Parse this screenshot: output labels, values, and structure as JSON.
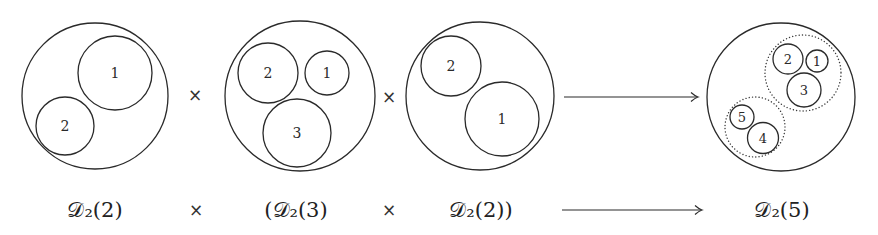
{
  "diagram": {
    "stroke_color": "#2a2a2a",
    "background": "#ffffff",
    "disks": [
      {
        "id": "A",
        "outer": {
          "cx": 95,
          "cy": 96,
          "r": 73
        },
        "inner": [
          {
            "label": "1",
            "cx": 115,
            "cy": 73,
            "r": 37
          },
          {
            "label": "2",
            "cx": 65,
            "cy": 126,
            "r": 29
          }
        ]
      },
      {
        "id": "B",
        "outer": {
          "cx": 300,
          "cy": 96,
          "r": 75
        },
        "inner": [
          {
            "label": "2",
            "cx": 268,
            "cy": 73,
            "r": 30
          },
          {
            "label": "1",
            "cx": 327,
            "cy": 73,
            "r": 22
          },
          {
            "label": "3",
            "cx": 297,
            "cy": 133,
            "r": 34
          }
        ]
      },
      {
        "id": "C",
        "outer": {
          "cx": 480,
          "cy": 96,
          "r": 74
        },
        "inner": [
          {
            "label": "2",
            "cx": 451,
            "cy": 66,
            "r": 30
          },
          {
            "label": "1",
            "cx": 502,
            "cy": 119,
            "r": 37
          }
        ]
      },
      {
        "id": "D",
        "outer": {
          "cx": 781,
          "cy": 97,
          "r": 74
        },
        "dotted": [
          {
            "cx": 803,
            "cy": 73,
            "r": 38
          },
          {
            "cx": 755,
            "cy": 127,
            "r": 30
          }
        ],
        "inner": [
          {
            "label": "2",
            "cx": 788,
            "cy": 59,
            "r": 15
          },
          {
            "label": "1",
            "cx": 817,
            "cy": 61,
            "r": 11
          },
          {
            "label": "3",
            "cx": 804,
            "cy": 90,
            "r": 17
          },
          {
            "label": "5",
            "cx": 742,
            "cy": 117,
            "r": 12
          },
          {
            "label": "4",
            "cx": 763,
            "cy": 138,
            "r": 15.5
          }
        ]
      }
    ],
    "operators_top": [
      {
        "symbol": "×",
        "x": 195,
        "y": 95
      },
      {
        "symbol": "×",
        "x": 389,
        "y": 97
      }
    ],
    "arrow_top": {
      "x1": 564,
      "x2": 698,
      "y": 97
    },
    "bottom_row": {
      "labels": [
        {
          "text": "𝒟₂(2)",
          "x": 95
        },
        {
          "text": "×",
          "x": 196
        },
        {
          "text": "(𝒟₂(3)",
          "x": 296
        },
        {
          "text": "×",
          "x": 389
        },
        {
          "text": "𝒟₂(2))",
          "x": 481
        },
        {
          "text": "𝒟₂(5)",
          "x": 782
        }
      ],
      "arrow": {
        "x1": 562,
        "x2": 702,
        "y": 210
      }
    }
  }
}
